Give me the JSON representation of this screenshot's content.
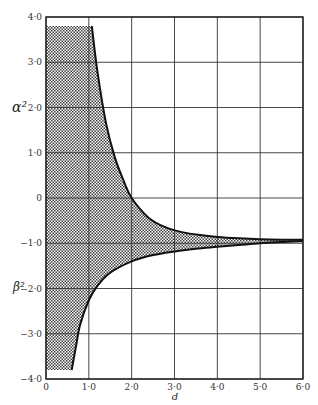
{
  "chart_data": {
    "type": "area",
    "title": "",
    "xlabel": "d",
    "ylabel_upper": "α²",
    "ylabel_lower": "β²",
    "xlim": [
      0,
      6.0
    ],
    "ylim": [
      -4.0,
      4.0
    ],
    "grid": true,
    "x_ticks": [
      "0",
      "1·0",
      "2·0",
      "3·0",
      "4·0",
      "5·0",
      "6·0"
    ],
    "x_tick_values": [
      0,
      1,
      2,
      3,
      4,
      5,
      6
    ],
    "y_ticks": [
      "4·0",
      "3·0",
      "2·0",
      "1·0",
      "0",
      "−1·0",
      "−2·0",
      "−3·0",
      "−4·0"
    ],
    "y_tick_values": [
      4,
      3,
      2,
      1,
      0,
      -1,
      -2,
      -3,
      -4
    ],
    "asymptote": -0.93,
    "series": [
      {
        "name": "upper boundary (α²)",
        "x": [
          1.07,
          1.2,
          1.4,
          1.6,
          1.8,
          2.0,
          2.4,
          2.8,
          3.2,
          3.6,
          4.0,
          4.5,
          5.0,
          5.5,
          6.0
        ],
        "y": [
          3.8,
          2.8,
          1.66,
          0.92,
          0.41,
          0.0,
          -0.44,
          -0.65,
          -0.76,
          -0.82,
          -0.86,
          -0.89,
          -0.91,
          -0.92,
          -0.925
        ]
      },
      {
        "name": "lower boundary (β²)",
        "x": [
          0.6,
          0.7,
          0.8,
          1.0,
          1.2,
          1.5,
          2.0,
          2.5,
          3.0,
          3.5,
          4.0,
          4.5,
          5.0,
          5.5,
          6.0
        ],
        "y": [
          -3.8,
          -3.28,
          -2.79,
          -2.26,
          -1.94,
          -1.65,
          -1.4,
          -1.26,
          -1.18,
          -1.12,
          -1.08,
          -1.04,
          -1.0,
          -0.97,
          -0.95
        ]
      }
    ],
    "shaded_region": {
      "description": "cross-hatched region bounded by d=0, α²≈3.8 (top), upper curve, lower curve and β²≈−3.8 (bottom)",
      "top_value": 3.8,
      "bottom_value": -3.8,
      "pattern": "crosshatch"
    }
  }
}
